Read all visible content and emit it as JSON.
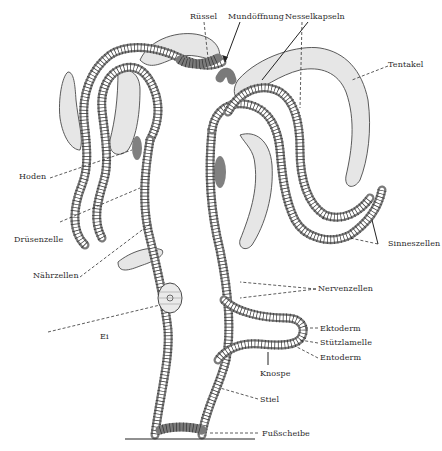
{
  "figure": {
    "language": "de"
  },
  "labels": {
    "ruessel": "Rüssel",
    "mundoeffnung": "Mundöffnung",
    "nesselkapseln": "Nesselkapseln",
    "tentakel": "Tentakel",
    "hoden": "Hoden",
    "druesenzelle": "Drüsenzelle",
    "naehrzellen": "Nährzellen",
    "sinneszellen": "Sinneszellen",
    "nervenzellen": "Nervenzellen",
    "ei": "Ei",
    "ektoderm": "Ektoderm",
    "stuetzlamelle": "Stützlamelle",
    "entoderm": "Entoderm",
    "knospe": "Knospe",
    "stiel": "Stiel",
    "fussscheibe": "Fußscheibe"
  },
  "colors": {
    "background": "#ffffff",
    "ink": "#2a2a2a",
    "tentacle_shade": "#e6e6e6"
  }
}
